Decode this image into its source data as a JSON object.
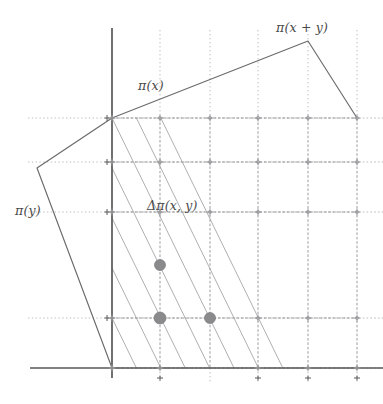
{
  "figure": {
    "width": 383,
    "height": 404,
    "background_color": "#ffffff"
  },
  "labels": [
    {
      "id": "pi-x-plus-y",
      "text": "π(x + y)",
      "x": 276,
      "y": 20,
      "name": "label-pi-x-plus-y"
    },
    {
      "id": "pi-x",
      "text": "π(x)",
      "x": 138,
      "y": 78,
      "name": "label-pi-x"
    },
    {
      "id": "pi-y",
      "text": "π(y)",
      "x": 15,
      "y": 203,
      "name": "label-pi-y"
    },
    {
      "id": "delta-pi-x-y",
      "text": "Δπ(x, y)",
      "x": 147,
      "y": 198,
      "name": "label-delta-pi-x-y"
    }
  ],
  "colors": {
    "axis": "#58585a",
    "polygon": "#6b6b6d",
    "grid_solid": "#8d8d90",
    "grid_dotted": "#b2b2b5",
    "diagonal": "#a0a0a3",
    "lattice_marker": "#9a9a9d",
    "filled_dot": "#8a8a8d",
    "label_text": "#4a4a4a"
  },
  "axes": {
    "horizontal": {
      "x1": 30,
      "y1": 368,
      "x2": 383,
      "y2": 368
    },
    "vertical": {
      "x1": 112,
      "y1": 28,
      "x2": 112,
      "y2": 378
    }
  },
  "grid": {
    "column_x": [
      112,
      160,
      210,
      258,
      308,
      357
    ],
    "row_y": [
      118,
      162,
      212,
      265,
      318,
      368
    ],
    "solid_rows": [
      118,
      162,
      212,
      318,
      368
    ],
    "dotted_extension_right": 383
  },
  "polygon": {
    "label": "Newton polygon boundary",
    "vertices": [
      {
        "x": 112,
        "y": 368
      },
      {
        "x": 37,
        "y": 168
      },
      {
        "x": 112,
        "y": 118
      },
      {
        "x": 308,
        "y": 41
      },
      {
        "x": 357,
        "y": 118
      }
    ],
    "closed": false
  },
  "diagonals": {
    "description": "Parallel lines of slope descending two rows per column",
    "count": 7
  },
  "lattice_points": [
    {
      "x": 112,
      "y": 118
    },
    {
      "x": 160,
      "y": 118
    },
    {
      "x": 210,
      "y": 118
    },
    {
      "x": 258,
      "y": 118
    },
    {
      "x": 308,
      "y": 118
    },
    {
      "x": 357,
      "y": 118
    },
    {
      "x": 112,
      "y": 162
    },
    {
      "x": 160,
      "y": 162
    },
    {
      "x": 210,
      "y": 162
    },
    {
      "x": 258,
      "y": 162
    },
    {
      "x": 308,
      "y": 162
    },
    {
      "x": 357,
      "y": 162
    },
    {
      "x": 112,
      "y": 212
    },
    {
      "x": 160,
      "y": 212
    },
    {
      "x": 210,
      "y": 212
    },
    {
      "x": 258,
      "y": 212
    },
    {
      "x": 308,
      "y": 212
    },
    {
      "x": 357,
      "y": 212
    },
    {
      "x": 112,
      "y": 318
    },
    {
      "x": 258,
      "y": 318
    },
    {
      "x": 308,
      "y": 318
    },
    {
      "x": 357,
      "y": 318
    },
    {
      "x": 112,
      "y": 368
    },
    {
      "x": 160,
      "y": 368
    },
    {
      "x": 258,
      "y": 368
    },
    {
      "x": 308,
      "y": 368
    },
    {
      "x": 357,
      "y": 368
    }
  ],
  "filled_points": [
    {
      "x": 160,
      "y": 265,
      "r": 5.5,
      "name": "filled-lattice-dot-1"
    },
    {
      "x": 160,
      "y": 318,
      "r": 6.0,
      "name": "filled-lattice-dot-2"
    },
    {
      "x": 210,
      "y": 318,
      "r": 5.5,
      "name": "filled-lattice-dot-3"
    }
  ],
  "tick_marks": [
    {
      "x": 112,
      "y": 118
    },
    {
      "x": 112,
      "y": 162
    },
    {
      "x": 112,
      "y": 212
    },
    {
      "x": 112,
      "y": 318
    },
    {
      "x": 160,
      "y": 378
    },
    {
      "x": 258,
      "y": 378
    },
    {
      "x": 308,
      "y": 378
    },
    {
      "x": 357,
      "y": 378
    }
  ]
}
